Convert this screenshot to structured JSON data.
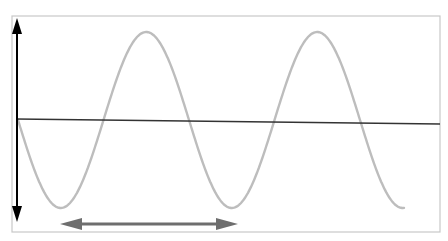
{
  "diagram": {
    "colors": {
      "frame": "#c8c8c8",
      "wave": "#bdbdbd",
      "axis": "#333333",
      "amplitude_arrow": "#000000",
      "wavelength_arrow": "#6e6e6e"
    },
    "frame": {
      "x": 12,
      "y": 16,
      "width": 428,
      "height": 216
    },
    "baseline": {
      "x1": 16,
      "y1": 119,
      "x2": 440,
      "y2": 124
    },
    "wave": {
      "start_x": 18,
      "end_x": 404,
      "center_y": 120,
      "amplitude": 88,
      "period": 171,
      "phase": "starts at zero going down"
    },
    "amplitude_arrow": {
      "x": 17,
      "y1": 18,
      "y2": 222,
      "double_headed": true
    },
    "wavelength_arrow": {
      "y": 224,
      "x1": 60,
      "x2": 238,
      "double_headed": true
    }
  }
}
